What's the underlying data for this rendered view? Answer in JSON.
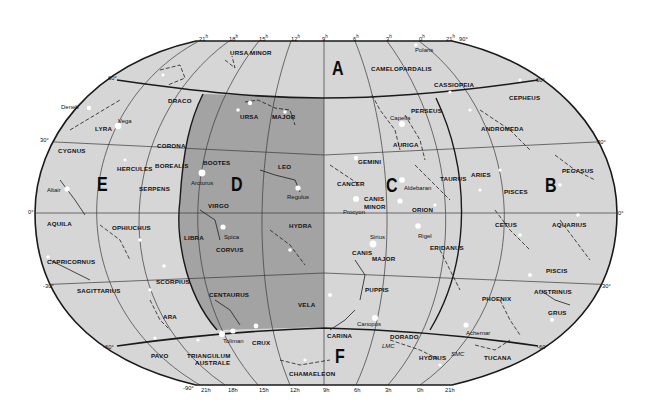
{
  "map": {
    "title": "Star chart of the celestial sphere",
    "colors": {
      "background": "#ffffff",
      "sky": "#d6d6d6",
      "shaded_region": "#a3a3a3",
      "grid": "#3a3a3a",
      "boundary": "#1a1a1a",
      "star": "#ffffff",
      "text": "#111111"
    },
    "region_letters": [
      {
        "id": "A",
        "label": "A",
        "x": 332,
        "y": 58
      },
      {
        "id": "B",
        "label": "B",
        "x": 545,
        "y": 175
      },
      {
        "id": "C",
        "label": "C",
        "x": 386,
        "y": 175
      },
      {
        "id": "D",
        "label": "D",
        "x": 231,
        "y": 174
      },
      {
        "id": "E",
        "label": "E",
        "x": 97,
        "y": 174
      },
      {
        "id": "F",
        "label": "F",
        "x": 335,
        "y": 346
      }
    ],
    "right_ascension_ticks_top": [
      {
        "label": "21",
        "unit": "h",
        "x": 199,
        "y": 35
      },
      {
        "label": "18",
        "unit": "h",
        "x": 229,
        "y": 35
      },
      {
        "label": "15",
        "unit": "h",
        "x": 259,
        "y": 35
      },
      {
        "label": "12",
        "unit": "h",
        "x": 291,
        "y": 35
      },
      {
        "label": "9",
        "unit": "h",
        "x": 322,
        "y": 35
      },
      {
        "label": "6",
        "unit": "h",
        "x": 353,
        "y": 35
      },
      {
        "label": "3",
        "unit": "h",
        "x": 386,
        "y": 35
      },
      {
        "label": "0",
        "unit": "h",
        "x": 419,
        "y": 35
      },
      {
        "label": "21",
        "unit": "h",
        "x": 446,
        "y": 35
      },
      {
        "label": "90°",
        "unit": "",
        "x": 459,
        "y": 37
      }
    ],
    "right_ascension_ticks_bottom": [
      {
        "label": "-90°",
        "x": 183,
        "y": 386
      },
      {
        "label": "21h",
        "x": 201,
        "y": 388
      },
      {
        "label": "18h",
        "x": 228,
        "y": 388
      },
      {
        "label": "15h",
        "x": 259,
        "y": 388
      },
      {
        "label": "12h",
        "x": 290,
        "y": 388
      },
      {
        "label": "9h",
        "x": 323,
        "y": 388
      },
      {
        "label": "6h",
        "x": 354,
        "y": 388
      },
      {
        "label": "3h",
        "x": 385,
        "y": 388
      },
      {
        "label": "0h",
        "x": 417,
        "y": 388
      },
      {
        "label": "21h",
        "x": 445,
        "y": 388
      }
    ],
    "declination_ticks": [
      {
        "label": "60°",
        "x": 108,
        "y": 76
      },
      {
        "label": "30°",
        "x": 40,
        "y": 138
      },
      {
        "label": "0°",
        "x": 28,
        "y": 210
      },
      {
        "label": "-30°",
        "x": 43,
        "y": 284
      },
      {
        "label": "-60°",
        "x": 103,
        "y": 345
      },
      {
        "label": "60°",
        "x": 536,
        "y": 78
      },
      {
        "label": "30°",
        "x": 597,
        "y": 140
      },
      {
        "label": "0°",
        "x": 618,
        "y": 211
      },
      {
        "label": "-30°",
        "x": 600,
        "y": 284
      },
      {
        "label": "-60°",
        "x": 537,
        "y": 345
      }
    ],
    "constellations": [
      {
        "name": "URSA MINOR",
        "x": 230,
        "y": 50
      },
      {
        "name": "CAMELOPARDALIS",
        "x": 371,
        "y": 66
      },
      {
        "name": "CASSIOPEIA",
        "x": 434,
        "y": 82
      },
      {
        "name": "CEPHEUS",
        "x": 509,
        "y": 95
      },
      {
        "name": "DRACO",
        "x": 168,
        "y": 98
      },
      {
        "name": "URSA",
        "x": 240,
        "y": 114
      },
      {
        "name": "MAJOR",
        "x": 272,
        "y": 114
      },
      {
        "name": "PERSEUS",
        "x": 411,
        "y": 108
      },
      {
        "name": "LYRA",
        "x": 95,
        "y": 126
      },
      {
        "name": "ANDROMEDA",
        "x": 481,
        "y": 126
      },
      {
        "name": "CORONA",
        "x": 157,
        "y": 143
      },
      {
        "name": "AURIGA",
        "x": 393,
        "y": 142
      },
      {
        "name": "CYGNUS",
        "x": 58,
        "y": 148
      },
      {
        "name": "BOOTES",
        "x": 203,
        "y": 160
      },
      {
        "name": "BOREALIS",
        "x": 155,
        "y": 163
      },
      {
        "name": "GEMINI",
        "x": 358,
        "y": 159
      },
      {
        "name": "HERCULES",
        "x": 117,
        "y": 166
      },
      {
        "name": "LEO",
        "x": 278,
        "y": 164
      },
      {
        "name": "PEGASUS",
        "x": 562,
        "y": 168
      },
      {
        "name": "TAURUS",
        "x": 440,
        "y": 176
      },
      {
        "name": "ARIES",
        "x": 471,
        "y": 172
      },
      {
        "name": "CANCER",
        "x": 337,
        "y": 181
      },
      {
        "name": "SERPENS",
        "x": 139,
        "y": 186
      },
      {
        "name": "PISCES",
        "x": 504,
        "y": 189
      },
      {
        "name": "CANIS",
        "x": 364,
        "y": 196
      },
      {
        "name": "MINOR",
        "x": 364,
        "y": 204
      },
      {
        "name": "VIRGO",
        "x": 208,
        "y": 203
      },
      {
        "name": "ORION",
        "x": 412,
        "y": 207
      },
      {
        "name": "AQUILA",
        "x": 47,
        "y": 221
      },
      {
        "name": "CETUS",
        "x": 495,
        "y": 222
      },
      {
        "name": "AQUARIUS",
        "x": 552,
        "y": 222
      },
      {
        "name": "OPHIUCHUS",
        "x": 112,
        "y": 225
      },
      {
        "name": "HYDRA",
        "x": 289,
        "y": 223
      },
      {
        "name": "LIBRA",
        "x": 184,
        "y": 235
      },
      {
        "name": "ERIDANUS",
        "x": 430,
        "y": 245
      },
      {
        "name": "CORVUS",
        "x": 216,
        "y": 247
      },
      {
        "name": "CANIS",
        "x": 352,
        "y": 250
      },
      {
        "name": "MAJOR",
        "x": 372,
        "y": 256
      },
      {
        "name": "CAPRICORNUS",
        "x": 47,
        "y": 259
      },
      {
        "name": "SCORPIUS",
        "x": 156,
        "y": 279
      },
      {
        "name": "PISCIS",
        "x": 546,
        "y": 268
      },
      {
        "name": "SAGITTARIUS",
        "x": 77,
        "y": 288
      },
      {
        "name": "PUPPIS",
        "x": 365,
        "y": 287
      },
      {
        "name": "AUSTRINUS",
        "x": 534,
        "y": 289
      },
      {
        "name": "CENTAURUS",
        "x": 209,
        "y": 292
      },
      {
        "name": "PHOENIX",
        "x": 482,
        "y": 296
      },
      {
        "name": "VELA",
        "x": 298,
        "y": 302
      },
      {
        "name": "GRUS",
        "x": 548,
        "y": 310
      },
      {
        "name": "ARA",
        "x": 163,
        "y": 314
      },
      {
        "name": "CARINA",
        "x": 327,
        "y": 333
      },
      {
        "name": "DORADO",
        "x": 390,
        "y": 334
      },
      {
        "name": "CRUX",
        "x": 252,
        "y": 340
      },
      {
        "name": "PAVO",
        "x": 151,
        "y": 353
      },
      {
        "name": "TRIANGULUM",
        "x": 187,
        "y": 353
      },
      {
        "name": "AUSTRALE",
        "x": 195,
        "y": 360
      },
      {
        "name": "HYDRUS",
        "x": 419,
        "y": 355
      },
      {
        "name": "TUCANA",
        "x": 484,
        "y": 355
      },
      {
        "name": "CHAMAELEON",
        "x": 289,
        "y": 371
      }
    ],
    "named_stars": [
      {
        "name": "Polaris",
        "x": 415,
        "y": 47,
        "italic": false
      },
      {
        "name": "Deneb",
        "x": 61,
        "y": 104,
        "italic": false
      },
      {
        "name": "Vega",
        "x": 118,
        "y": 118,
        "italic": false
      },
      {
        "name": "Capella",
        "x": 390,
        "y": 115,
        "italic": false
      },
      {
        "name": "Arcturus",
        "x": 191,
        "y": 180,
        "italic": false
      },
      {
        "name": "Altair",
        "x": 47,
        "y": 187,
        "italic": false
      },
      {
        "name": "Regulus",
        "x": 287,
        "y": 194,
        "italic": false
      },
      {
        "name": "Aldebaran",
        "x": 404,
        "y": 185,
        "italic": false
      },
      {
        "name": "Procyon",
        "x": 343,
        "y": 209,
        "italic": false
      },
      {
        "name": "Spica",
        "x": 224,
        "y": 234,
        "italic": false
      },
      {
        "name": "Rigel",
        "x": 418,
        "y": 233,
        "italic": false
      },
      {
        "name": "Sirius",
        "x": 370,
        "y": 234,
        "italic": false
      },
      {
        "name": "Canopus",
        "x": 357,
        "y": 321,
        "italic": false
      },
      {
        "name": "Achernar",
        "x": 466,
        "y": 330,
        "italic": false
      },
      {
        "name": "Toliman",
        "x": 223,
        "y": 338,
        "italic": false
      },
      {
        "name": "LMC",
        "x": 382,
        "y": 343,
        "italic": true
      },
      {
        "name": "SMC",
        "x": 451,
        "y": 351,
        "italic": true
      }
    ]
  }
}
